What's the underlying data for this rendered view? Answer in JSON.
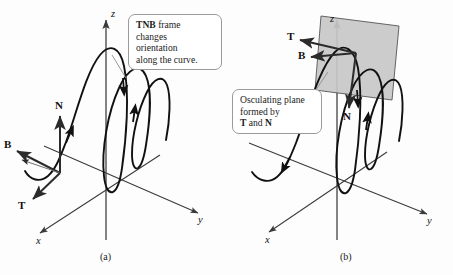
{
  "figure": {
    "background_color": "#fdfdfd",
    "curve_color": "#111111",
    "axis_color": "#3a3a3a",
    "vector_color": "#2b2b2b",
    "plane_fill": "#c8c8c8",
    "plane_stroke": "#555555",
    "callout_border": "#9a9a9a"
  },
  "panel_a": {
    "caption": "(a)",
    "callout": {
      "bold_lead": "TNB",
      "rest": " frame changes orientation along the curve.",
      "line1_bold": "TNB",
      "line1_rest": " frame",
      "line2": "changes",
      "line3": "orientation",
      "line4": "along the curve."
    },
    "axes": [
      {
        "name": "z",
        "label": "z",
        "direction": "up"
      },
      {
        "name": "y",
        "label": "y",
        "direction": "down-right"
      },
      {
        "name": "x",
        "label": "x",
        "direction": "down-left"
      }
    ],
    "vectors": [
      {
        "name": "N",
        "label": "N",
        "direction": "up"
      },
      {
        "name": "B",
        "label": "B",
        "direction": "up-left"
      },
      {
        "name": "T",
        "label": "T",
        "direction": "down-left"
      }
    ]
  },
  "panel_b": {
    "caption": "(b)",
    "callout": {
      "line1": "Osculating plane",
      "line2": "formed by",
      "line3_boldT": "T",
      "line3_mid": " and ",
      "line3_boldN": "N"
    },
    "axes": [
      {
        "name": "z",
        "label": "z",
        "direction": "up"
      },
      {
        "name": "y",
        "label": "y",
        "direction": "down-right"
      },
      {
        "name": "x",
        "label": "x",
        "direction": "down-left"
      }
    ],
    "vectors": [
      {
        "name": "T",
        "label": "T",
        "direction": "left"
      },
      {
        "name": "B",
        "label": "B",
        "direction": "left"
      },
      {
        "name": "N",
        "label": "N",
        "direction": "down"
      }
    ],
    "plane": {
      "name": "osculating-plane",
      "shape": "parallelogram",
      "fill": "#c8c8c8"
    }
  }
}
